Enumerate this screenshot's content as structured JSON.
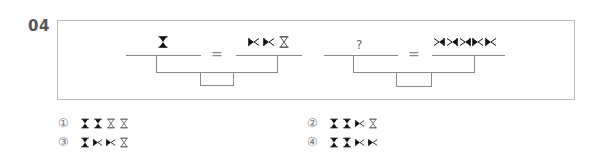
{
  "question": {
    "number": "04",
    "equations": [
      {
        "left": [
          "hourglass-filled"
        ],
        "equals": "=",
        "right": [
          "bowtie-filled-left",
          "bowtie-filled-left",
          "hourglass-outline"
        ]
      },
      {
        "left_placeholder": "?",
        "equals": "=",
        "right": [
          "bowtie-filled-right",
          "bowtie-filled-right",
          "bowtie-filled-right",
          "bowtie-filled-left",
          "bowtie-filled-left"
        ]
      }
    ]
  },
  "options": [
    {
      "number": "①",
      "symbols": [
        "hourglass-filled",
        "hourglass-filled",
        "hourglass-outline",
        "hourglass-outline"
      ]
    },
    {
      "number": "②",
      "symbols": [
        "hourglass-filled",
        "hourglass-filled",
        "bowtie-filled-left",
        "hourglass-outline"
      ]
    },
    {
      "number": "③",
      "symbols": [
        "hourglass-filled",
        "bowtie-filled-left",
        "bowtie-filled-left",
        "hourglass-outline"
      ]
    },
    {
      "number": "④",
      "symbols": [
        "hourglass-filled",
        "hourglass-filled",
        "bowtie-filled-left",
        "bowtie-filled-left"
      ]
    }
  ],
  "colors": {
    "ink": "#111111",
    "line": "#8a8a8a",
    "frame": "#b8b8b8",
    "number": "#555555"
  }
}
